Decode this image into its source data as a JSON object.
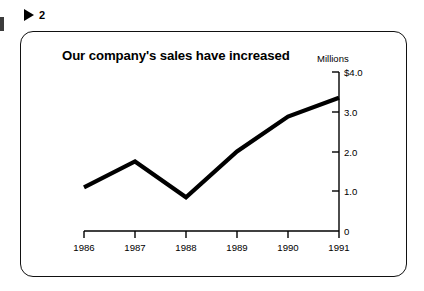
{
  "figure_marker": {
    "icon": "play-triangle-icon",
    "number": "2"
  },
  "chart_title": "Our company's sales\nhave increased",
  "chart_data": {
    "type": "line",
    "title": "Our company's sales have increased",
    "xlabel": "",
    "ylabel": "Millions",
    "unit_label": "Millions",
    "categories": [
      "1986",
      "1987",
      "1988",
      "1989",
      "1990",
      "1991"
    ],
    "values": [
      1.1,
      1.75,
      0.85,
      2.0,
      2.88,
      3.35
    ],
    "series": [
      {
        "name": "Sales",
        "values": [
          1.1,
          1.75,
          0.85,
          2.0,
          2.88,
          3.35
        ]
      }
    ],
    "ylim": [
      0,
      4.0
    ],
    "ytick_values": [
      4.0,
      3.0,
      2.0,
      1.0,
      0
    ],
    "ytick_labels": [
      "$4.0",
      "3.0",
      "2.0",
      "1.0",
      "0"
    ],
    "xtick_labels": [
      "1986",
      "1987",
      "1988",
      "1989",
      "1990",
      "1991"
    ],
    "grid": false,
    "legend": "none",
    "line_color": "#000000",
    "axis_color": "#000000",
    "background_color": "#ffffff"
  }
}
